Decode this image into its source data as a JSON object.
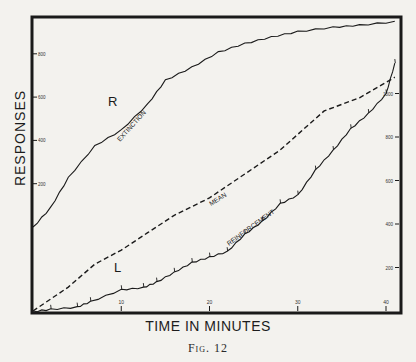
{
  "figure": {
    "caption": "Fig. 12",
    "xlabel": "TIME IN MINUTES",
    "ylabel": "RESPONSES"
  },
  "chart_data": {
    "type": "line",
    "title": "",
    "xlabel": "TIME IN MINUTES",
    "ylabel": "RESPONSES",
    "x_ticks": [
      10,
      20,
      30,
      40
    ],
    "xlim": [
      0,
      41
    ],
    "left_axis": {
      "ticks": [
        200,
        400,
        600,
        800
      ],
      "applies_to": "Extinction (R)",
      "ylim": [
        0,
        950
      ]
    },
    "right_axis": {
      "ticks": [
        200,
        400,
        600,
        800,
        1000
      ],
      "applies_to": "Reinforcement (L)",
      "ylim": [
        0,
        1200
      ]
    },
    "grid": false,
    "annotations": [
      "R",
      "L",
      "EXTINCTION",
      "MEAN",
      "REINFORCEMENT"
    ],
    "series": [
      {
        "name": "EXTINCTION",
        "side": "R",
        "axis": "left",
        "style": "solid",
        "x": [
          0,
          2,
          4,
          7,
          10,
          13,
          15,
          18,
          21,
          24,
          27,
          30,
          34,
          37,
          41
        ],
        "values": [
          0,
          92,
          230,
          377,
          450,
          570,
          680,
          740,
          810,
          850,
          880,
          905,
          925,
          935,
          950
        ]
      },
      {
        "name": "REINFORCEMENT",
        "side": "L",
        "axis": "right",
        "style": "solid-with-tick-marks",
        "x": [
          0,
          2,
          5,
          6.5,
          10,
          12.5,
          14,
          16,
          18,
          20,
          22,
          24,
          26,
          28,
          30,
          32,
          34,
          36,
          38,
          40,
          41
        ],
        "values": [
          0,
          10,
          20,
          45,
          100,
          110,
          135,
          180,
          225,
          250,
          275,
          355,
          415,
          495,
          535,
          650,
          740,
          840,
          910,
          1000,
          1140
        ]
      },
      {
        "name": "MEAN",
        "axis": "right",
        "style": "dashed",
        "x": [
          0,
          4,
          7,
          10,
          13,
          16,
          20,
          28,
          33,
          37,
          41
        ],
        "values": [
          0,
          110,
          215,
          280,
          360,
          440,
          520,
          740,
          920,
          980,
          1075
        ]
      }
    ]
  },
  "labels": {
    "R": "R",
    "L": "L",
    "extinction": "EXTINCTION",
    "mean": "MEAN",
    "reinforcement": "REINFORCEMENT"
  }
}
